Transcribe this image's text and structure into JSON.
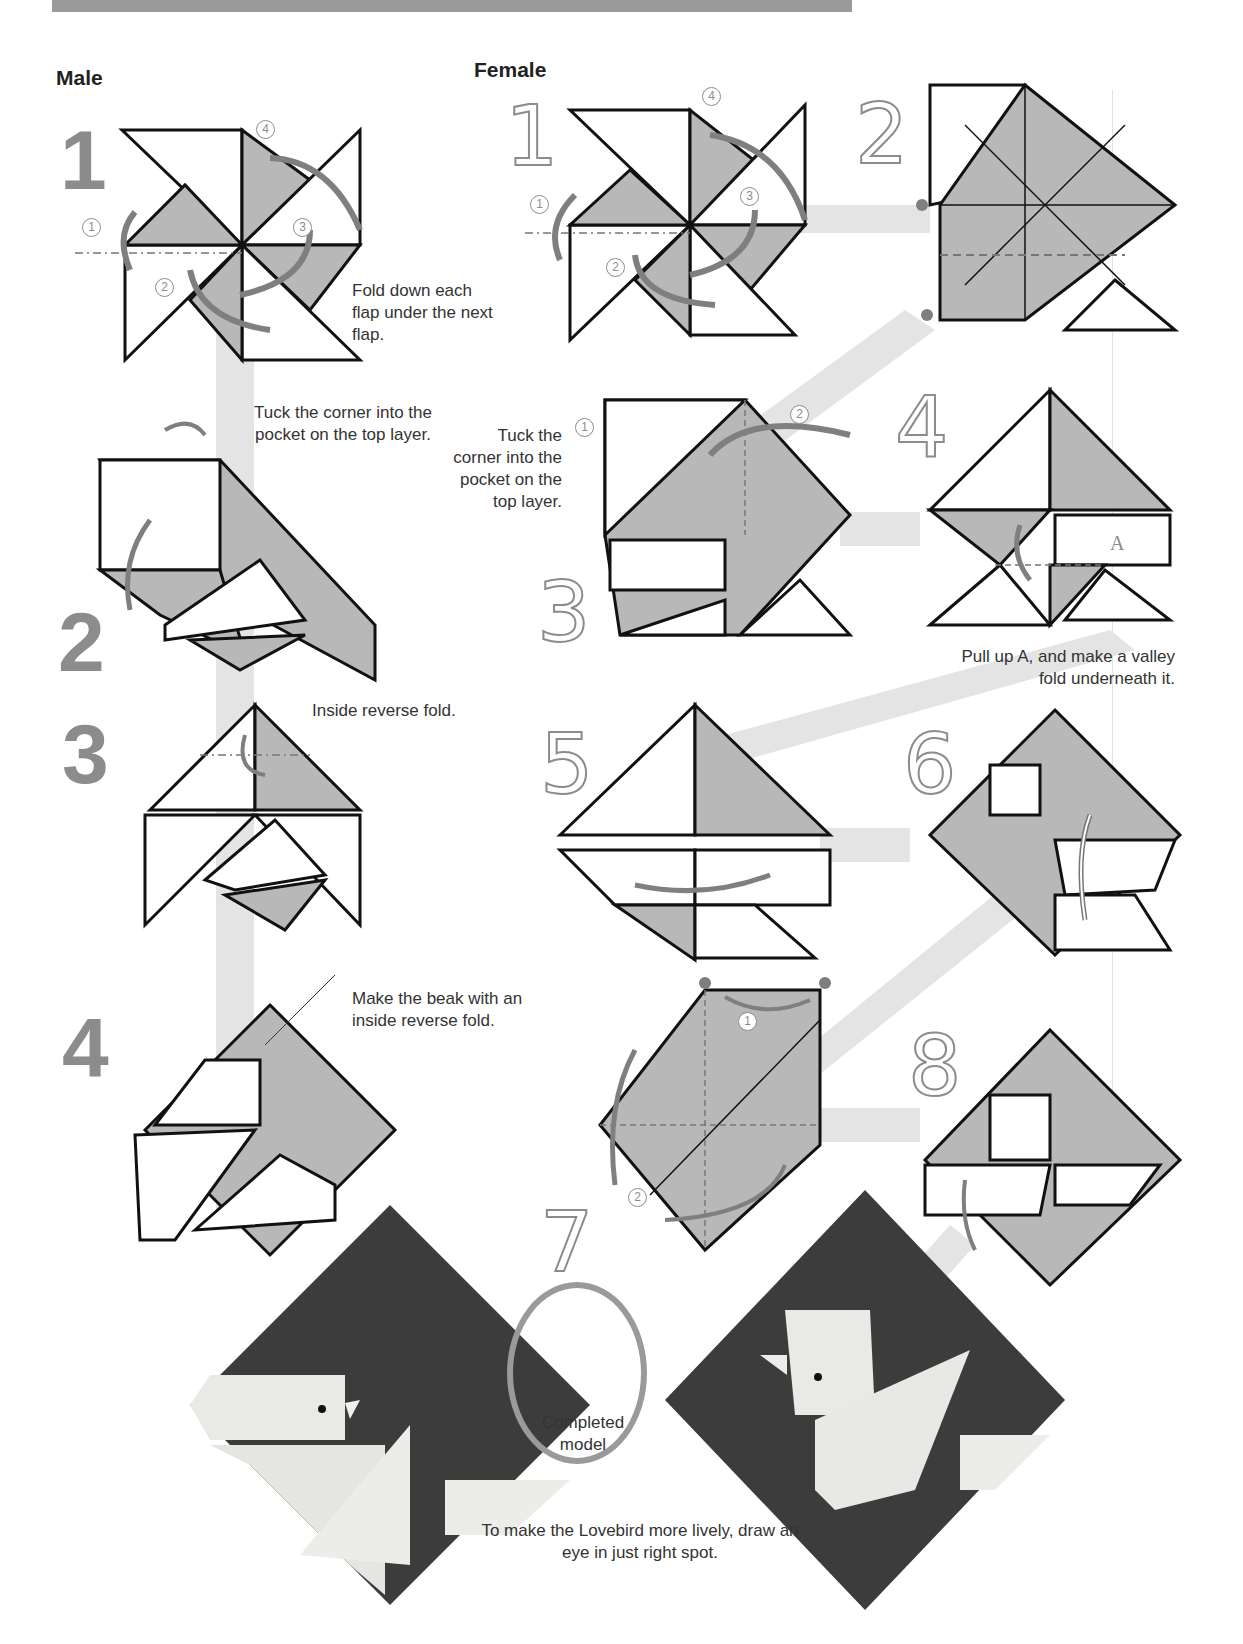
{
  "page": {
    "columns": {
      "male": {
        "title": "Male"
      },
      "female": {
        "title": "Female"
      }
    },
    "male_steps": [
      {
        "number": "1",
        "caption": "Fold down each flap under the next flap.",
        "sub_steps": [
          "1",
          "2",
          "3",
          "4"
        ]
      },
      {
        "number": "2",
        "caption": "Tuck the corner into the pocket on the top layer."
      },
      {
        "number": "3",
        "caption": "Inside reverse fold."
      },
      {
        "number": "4",
        "caption": "Make the beak with an inside reverse fold."
      }
    ],
    "female_steps": [
      {
        "number": "1",
        "sub_steps": [
          "1",
          "2",
          "3",
          "4"
        ]
      },
      {
        "number": "2"
      },
      {
        "number": "3",
        "caption": "Tuck the corner into the pocket on the top layer.",
        "sub_steps": [
          "1",
          "2"
        ]
      },
      {
        "number": "4",
        "caption": "Pull up A, and make a valley fold underneath it.",
        "label": "A"
      },
      {
        "number": "5"
      },
      {
        "number": "6"
      },
      {
        "number": "7",
        "sub_steps": [
          "1",
          "2"
        ]
      },
      {
        "number": "8"
      }
    ],
    "completed": {
      "label": "Completed model",
      "tip": "To make the Lovebird more lively, draw an eye in just right spot."
    },
    "colors": {
      "paper_gray": "#b8b8b8",
      "paper_white": "#ffffff",
      "arrow_gray": "#7f7f7f",
      "model_dark": "#3c3c3c",
      "model_light": "#e9e9e6",
      "connector": "#e4e4e4"
    }
  }
}
